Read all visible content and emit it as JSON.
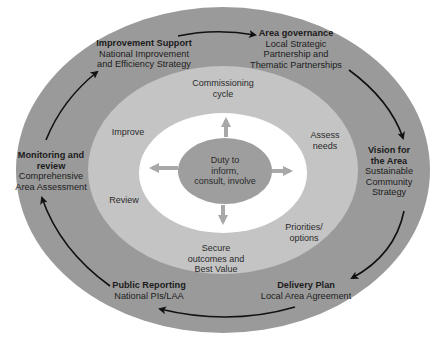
{
  "colors": {
    "outer_ring": "#9a9a9a",
    "middle_ring": "#c4c4c4",
    "inner_ring": "#ffffff",
    "core": "#9e9e9e",
    "arrows_outer": "#111111",
    "arrows_inner": "#a8a8a8"
  },
  "outer_cycle": [
    {
      "title": "Improvement Support",
      "lines": [
        "National Improvement",
        "and Efficiency Strategy"
      ]
    },
    {
      "title": "Area governance",
      "lines": [
        "Local Strategic",
        "Partnership and",
        "Thematic Partnerships"
      ]
    },
    {
      "title_lines": [
        "Vision for",
        "the Area"
      ],
      "lines": [
        "Sustainable",
        "Community",
        "Strategy"
      ]
    },
    {
      "title": "Delivery Plan",
      "lines": [
        "Local Area Agreement"
      ]
    },
    {
      "title": "Public Reporting",
      "lines": [
        "National PIs/LAA"
      ]
    },
    {
      "title_lines": [
        "Monitoring and",
        "review"
      ],
      "lines": [
        "Comprehensive",
        "Area Assessment"
      ]
    }
  ],
  "commissioning_cycle": {
    "title_lines": [
      "Commissioning",
      "cycle"
    ],
    "stages": [
      {
        "lines": [
          "Assess",
          "needs"
        ]
      },
      {
        "lines": [
          "Priorities/",
          "options"
        ]
      },
      {
        "lines": [
          "Secure",
          "outcomes and",
          "Best Value"
        ]
      },
      {
        "lines": [
          "Review"
        ]
      },
      {
        "lines": [
          "Improve"
        ]
      }
    ]
  },
  "core": {
    "lines": [
      "Duty to",
      "inform,",
      "consult, involve"
    ]
  }
}
